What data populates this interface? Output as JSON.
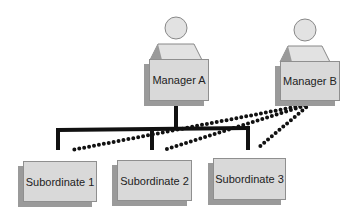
{
  "diagram": {
    "type": "org-chart-dual-reporting",
    "managers": [
      {
        "id": "manager-a",
        "label": "Manager A"
      },
      {
        "id": "manager-b",
        "label": "Manager B"
      }
    ],
    "subordinates": [
      {
        "id": "subordinate-1",
        "label": "Subordinate 1"
      },
      {
        "id": "subordinate-2",
        "label": "Subordinate 2"
      },
      {
        "id": "subordinate-3",
        "label": "Subordinate 3"
      }
    ],
    "edges": [
      {
        "from": "manager-a",
        "to": "subordinate-1",
        "style": "solid"
      },
      {
        "from": "manager-a",
        "to": "subordinate-2",
        "style": "solid"
      },
      {
        "from": "manager-a",
        "to": "subordinate-3",
        "style": "solid"
      },
      {
        "from": "manager-b",
        "to": "subordinate-1",
        "style": "dotted"
      },
      {
        "from": "manager-b",
        "to": "subordinate-2",
        "style": "dotted"
      },
      {
        "from": "manager-b",
        "to": "subordinate-3",
        "style": "dotted"
      }
    ],
    "colors": {
      "box_fill": "#d9d9d9",
      "box_shadow": "#9a9a9a",
      "figure_fill": "#e2e2e2",
      "line": "#111111"
    }
  }
}
